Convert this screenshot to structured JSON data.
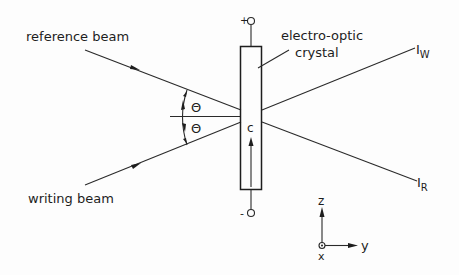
{
  "labels": {
    "reference_beam": "reference beam",
    "writing_beam": "writing beam",
    "crystal_line1": "electro-optic",
    "crystal_line2": "crystal",
    "theta_upper": "Θ",
    "theta_lower": "Θ",
    "c_axis": "c",
    "plus": "+",
    "minus": "-",
    "iw_main": "I",
    "iw_sub": "W",
    "ir_main": "I",
    "ir_sub": "R",
    "axis_z": "z",
    "axis_y": "y",
    "axis_x": "x"
  },
  "colors": {
    "line": "#2a2a2a",
    "text": "#1e1e1e",
    "background": "#fdfdfd"
  }
}
